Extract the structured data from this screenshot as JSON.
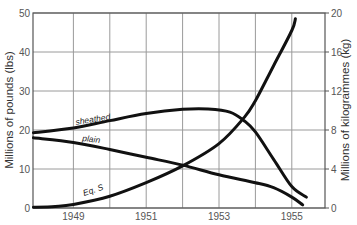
{
  "chart_data": {
    "type": "line",
    "title": "",
    "xlabel": "",
    "ylabel": "Millions of pounds (lbs)",
    "ylabel_right": "Millions of kilogrammes (kg)",
    "xlim": [
      1947.9,
      1956.0
    ],
    "ylim": [
      0,
      50
    ],
    "ylim_right": [
      0,
      20
    ],
    "x_ticks": [
      "1949",
      "1951",
      "1953",
      "1955"
    ],
    "y_ticks": [
      "0",
      "10",
      "20",
      "30",
      "40",
      "50"
    ],
    "y_ticks_right": [
      "0",
      "4",
      "8",
      "12",
      "16",
      "20"
    ],
    "grid": true,
    "legend": "inline labels",
    "series": [
      {
        "name": "sheathed",
        "x": [
          1947.9,
          1949,
          1950,
          1951,
          1952,
          1952.7,
          1953.3,
          1953.7,
          1954,
          1954.5,
          1955,
          1955.4
        ],
        "values": [
          19.3,
          20.5,
          22.4,
          24.2,
          25.3,
          25.4,
          24.6,
          22.3,
          19.5,
          12.5,
          5.5,
          2.8
        ]
      },
      {
        "name": "plain",
        "x": [
          1947.9,
          1949,
          1950,
          1951,
          1952,
          1953,
          1954,
          1954.5,
          1955,
          1955.3
        ],
        "values": [
          18.0,
          16.8,
          15.0,
          13.0,
          11.0,
          8.5,
          6.5,
          5.2,
          2.8,
          0.8
        ]
      },
      {
        "name": "Eq. S",
        "x": [
          1947.9,
          1948.5,
          1949,
          1950,
          1951,
          1952,
          1953,
          1953.7,
          1954,
          1954.5,
          1955,
          1955.1
        ],
        "values": [
          0.2,
          0.4,
          0.9,
          3.0,
          6.5,
          10.8,
          16.5,
          23.3,
          27.5,
          36.5,
          45.5,
          48.5
        ]
      }
    ]
  },
  "labels": {
    "left_axis_title": "Millions of pounds (lbs)",
    "right_axis_title": "Millions of kilogrammes (kg)",
    "sheathed": "sheathed",
    "plain": "plain",
    "eqs": "Eq. S"
  }
}
